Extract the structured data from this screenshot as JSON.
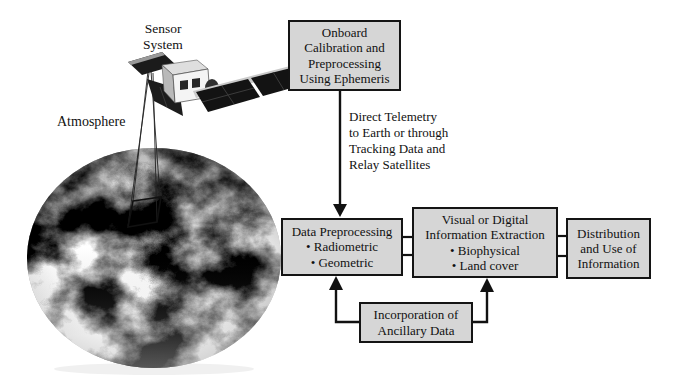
{
  "colors": {
    "background": "#ffffff",
    "box_fill": "#d6d6d6",
    "box_border": "#141414",
    "text": "#111111",
    "arrow": "#111111",
    "satellite_panel": "#131313",
    "earth_base": "#8f8f8f"
  },
  "scene": {
    "sensor_system_label": "Sensor\nSystem",
    "atmosphere_label": "Atmosphere"
  },
  "flow": {
    "onboard_box": "Onboard\nCalibration and\nPreprocessing\nUsing Ephemeris",
    "telemetry_label": "Direct Telemetry\nto Earth or through\nTracking Data and\nRelay Satellites",
    "data_preprocessing": {
      "title": "Data Preprocessing",
      "bullets": [
        "• Radiometric",
        "• Geometric"
      ]
    },
    "visual_extraction": {
      "title": "Visual or Digital\nInformation Extraction",
      "bullets": [
        "• Biophysical",
        "• Land cover"
      ]
    },
    "distribution_box": "Distribution\nand Use of\nInformation",
    "ancillary_box": "Incorporation of\nAncillary Data"
  }
}
